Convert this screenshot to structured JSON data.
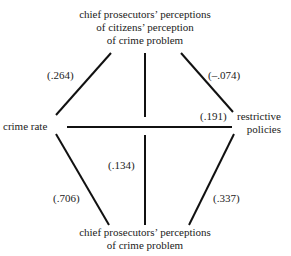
{
  "nodes": {
    "top": {
      "line1": "chief prosecutors’ perceptions",
      "line2": "of citizens’ perception",
      "line3": "of crime problem"
    },
    "left": {
      "label": "crime rate"
    },
    "right": {
      "line1": "restrictive",
      "line2": "policies"
    },
    "bottom": {
      "line1": "chief prosecutors’ perceptions",
      "line2": "of crime problem"
    }
  },
  "edges": [
    {
      "from": "crime rate",
      "to": "citizens' perception (top)",
      "coefficient": "(.264)"
    },
    {
      "from": "top",
      "to": "restrictive policies",
      "coefficient": "(–.074)"
    },
    {
      "from": "crime rate",
      "to": "restrictive policies",
      "coefficient": "(.191)"
    },
    {
      "from": "top",
      "to": "bottom",
      "coefficient": "(.134)"
    },
    {
      "from": "crime rate",
      "to": "bottom",
      "coefficient": "(.706)"
    },
    {
      "from": "bottom",
      "to": "restrictive policies",
      "coefficient": "(.337)"
    }
  ]
}
